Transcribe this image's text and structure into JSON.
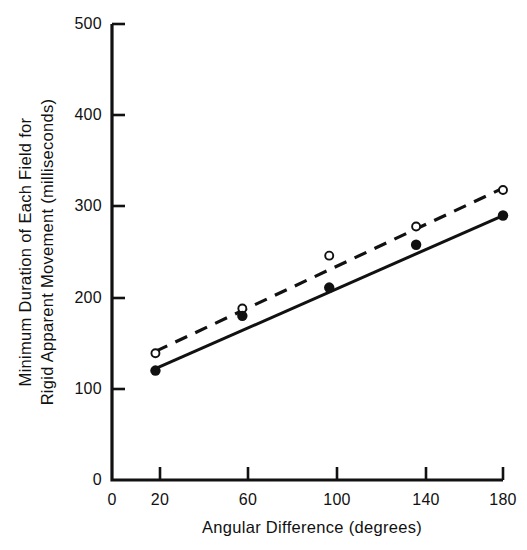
{
  "chart_data": {
    "type": "scatter",
    "title": "",
    "xlabel": "Angular Difference (degrees)",
    "ylabel": "Minimum Duration of Each Field for Rigid Apparent Movement (milliseconds)",
    "ylabel_lines": [
      "Minimum  Duration  of  Each  Field  for",
      "Rigid  Apparent  Movement  (milliseconds)"
    ],
    "xlim": [
      0,
      180
    ],
    "ylim": [
      0,
      500
    ],
    "grid": false,
    "legend": "none",
    "xticks": [
      0,
      20,
      60,
      100,
      140,
      180
    ],
    "xtick_labels": [
      "0",
      "20",
      "60",
      "100",
      "140",
      "180"
    ],
    "yticks": [
      0,
      100,
      200,
      300,
      400,
      500
    ],
    "ytick_labels": [
      "0",
      "100",
      "200",
      "300",
      "400",
      "500"
    ],
    "x": [
      20,
      60,
      100,
      140,
      180
    ],
    "series": [
      {
        "name": "open-circle-series",
        "marker": "open-circle",
        "line_style": "dashed",
        "color": "#111111",
        "values": [
          139,
          188,
          246,
          278,
          318
        ]
      },
      {
        "name": "filled-circle-series",
        "marker": "filled-circle",
        "line_style": "solid",
        "color": "#111111",
        "values": [
          120,
          180,
          211,
          258,
          290
        ]
      }
    ],
    "fit_lines": [
      {
        "name": "dashed-fit-line",
        "style": "dashed",
        "x_start": 20,
        "y_start": 141,
        "x_end": 180,
        "y_end": 320
      },
      {
        "name": "solid-fit-line",
        "style": "solid",
        "x_start": 20,
        "y_start": 122,
        "x_end": 180,
        "y_end": 290
      }
    ]
  }
}
